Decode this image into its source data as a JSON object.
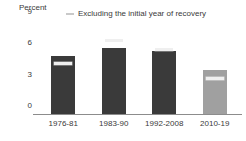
{
  "chart_data": {
    "type": "bar",
    "title": "",
    "ylabel": "Percent",
    "xlabel": "",
    "ylim": [
      0,
      9
    ],
    "yticks": [
      9,
      6,
      3,
      0
    ],
    "ytick_labels": [
      "9",
      "6",
      "3",
      "0"
    ],
    "grid": false,
    "categories": [
      "1976-81",
      "1983-90",
      "1992-2008",
      "2010-19"
    ],
    "series": [
      {
        "name": "Including the initial year of recovery",
        "values": [
          5.6,
          6.3,
          6.0,
          4.2
        ]
      },
      {
        "name": "Excluding the initial year of recovery",
        "values": [
          4.8,
          7.0,
          6.2,
          3.4
        ]
      }
    ],
    "bar_colors": [
      "#3a3a3a",
      "#3a3a3a",
      "#3a3a3a",
      "#a0a0a0"
    ],
    "marker_color": "#efefef",
    "legend": {
      "position": "top-center",
      "entries": [
        {
          "marker": "line-marker-icon",
          "label": "Excluding the initial year of recovery"
        }
      ]
    }
  },
  "axis": {
    "y_title": "Percent",
    "y_ticks": [
      "9",
      "6",
      "3",
      "0"
    ],
    "x_ticks": [
      "1976-81",
      "1983-90",
      "1992-2008",
      "2010-19"
    ]
  },
  "legend": {
    "entry_label": "Excluding the initial year of recovery"
  }
}
